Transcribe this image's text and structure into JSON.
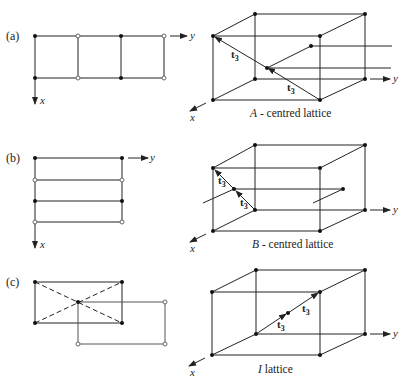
{
  "figure": {
    "panels": [
      {
        "id": "a",
        "label": "(a)",
        "caption_letter": "A",
        "caption_text": " - centred lattice",
        "vector_label": "t",
        "vector_sub": "3",
        "axis_x": "x",
        "axis_y": "y"
      },
      {
        "id": "b",
        "label": "(b)",
        "caption_letter": "B",
        "caption_text": " - centred lattice",
        "vector_label": "t",
        "vector_sub": "3",
        "axis_x": "x",
        "axis_y": "y"
      },
      {
        "id": "c",
        "label": "(c)",
        "caption_letter": "I",
        "caption_text": " lattice",
        "vector_label": "t",
        "vector_sub": "3",
        "axis_x": "x",
        "axis_y": "y"
      }
    ],
    "colors": {
      "line": "#222222",
      "lattice_point": "#111111",
      "open_point_stroke": "#666666",
      "background": "#ffffff"
    }
  }
}
